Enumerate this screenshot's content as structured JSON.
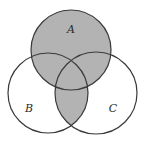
{
  "diagram": {
    "type": "venn",
    "sets": [
      {
        "id": "A",
        "label": "A",
        "cx": 71,
        "cy": 50,
        "r": 40,
        "label_x": 71,
        "label_y": 33
      },
      {
        "id": "B",
        "label": "B",
        "cx": 48,
        "cy": 93,
        "r": 40,
        "label_x": 29,
        "label_y": 112
      },
      {
        "id": "C",
        "label": "C",
        "cx": 96,
        "cy": 93,
        "r": 41,
        "label_x": 113,
        "label_y": 112
      }
    ],
    "shaded_region": "A ∪ (B ∩ C)",
    "colors": {
      "shade": "#b3b3b3",
      "stroke": "#3a3a3a",
      "background": "#ffffff"
    }
  }
}
